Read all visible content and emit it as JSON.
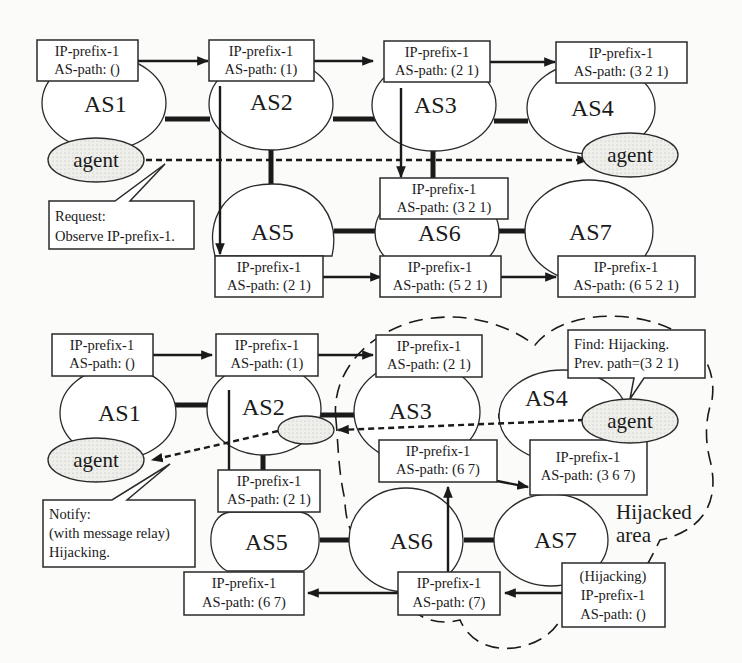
{
  "figure": {
    "top_panel": {
      "as_nodes": [
        {
          "id": "AS1",
          "label": "AS1"
        },
        {
          "id": "AS2",
          "label": "AS2"
        },
        {
          "id": "AS3",
          "label": "AS3"
        },
        {
          "id": "AS4",
          "label": "AS4"
        },
        {
          "id": "AS5",
          "label": "AS5"
        },
        {
          "id": "AS6",
          "label": "AS6"
        },
        {
          "id": "AS7",
          "label": "AS7"
        }
      ],
      "route_boxes": [
        {
          "at": "AS1",
          "prefix": "IP-prefix-1",
          "path": "AS-path: ()"
        },
        {
          "at": "AS2",
          "prefix": "IP-prefix-1",
          "path": "AS-path: (1)"
        },
        {
          "at": "AS3",
          "prefix": "IP-prefix-1",
          "path": "AS-path: (2 1)"
        },
        {
          "at": "AS4",
          "prefix": "IP-prefix-1",
          "path": "AS-path: (3 2 1)"
        },
        {
          "at": "AS6-top",
          "prefix": "IP-prefix-1",
          "path": "AS-path: (3 2 1)"
        },
        {
          "at": "AS5",
          "prefix": "IP-prefix-1",
          "path": "AS-path: (2 1)"
        },
        {
          "at": "AS6-bottom",
          "prefix": "IP-prefix-1",
          "path": "AS-path: (5 2 1)"
        },
        {
          "at": "AS7",
          "prefix": "IP-prefix-1",
          "path": "AS-path: (6 5 2 1)"
        }
      ],
      "agents": [
        {
          "at": "AS1",
          "label": "agent"
        },
        {
          "at": "AS4",
          "label": "agent"
        }
      ],
      "callout": {
        "line1": "Request:",
        "line2": "Observe IP-prefix-1."
      }
    },
    "bottom_panel": {
      "as_nodes": [
        {
          "id": "AS1",
          "label": "AS1"
        },
        {
          "id": "AS2",
          "label": "AS2"
        },
        {
          "id": "AS3",
          "label": "AS3"
        },
        {
          "id": "AS4",
          "label": "AS4"
        },
        {
          "id": "AS5",
          "label": "AS5"
        },
        {
          "id": "AS6",
          "label": "AS6"
        },
        {
          "id": "AS7",
          "label": "AS7"
        }
      ],
      "route_boxes": [
        {
          "at": "AS1",
          "prefix": "IP-prefix-1",
          "path": "AS-path: ()"
        },
        {
          "at": "AS2",
          "prefix": "IP-prefix-1",
          "path": "AS-path: (1)"
        },
        {
          "at": "AS3",
          "prefix": "IP-prefix-1",
          "path": "AS-path: (2 1)"
        },
        {
          "at": "AS6-top",
          "prefix": "IP-prefix-1",
          "path": "AS-path: (6 7)"
        },
        {
          "at": "AS4",
          "prefix": "IP-prefix-1",
          "path": "AS-path: (3 6 7)"
        },
        {
          "at": "AS5-top",
          "prefix": "IP-prefix-1",
          "path": "AS-path: (2 1)"
        },
        {
          "at": "AS5-bottom",
          "prefix": "IP-prefix-1",
          "path": "AS-path: (6 7)"
        },
        {
          "at": "AS6-bottom",
          "prefix": "IP-prefix-1",
          "path": "AS-path: (7)"
        }
      ],
      "hijack_box": {
        "line1": "(Hijacking)",
        "line2": "IP-prefix-1",
        "line3": "AS-path: ()"
      },
      "agents": [
        {
          "at": "AS1",
          "label": "agent"
        },
        {
          "at": "AS4",
          "label": "agent"
        }
      ],
      "notify_callout": {
        "line1": "Notify:",
        "line2": "(with message relay)",
        "line3": "Hijacking."
      },
      "find_callout": {
        "line1": "Find: Hijacking.",
        "line2": "Prev. path=(3 2 1)"
      },
      "area_label": {
        "line1": "Hijacked",
        "line2": "area"
      }
    }
  }
}
